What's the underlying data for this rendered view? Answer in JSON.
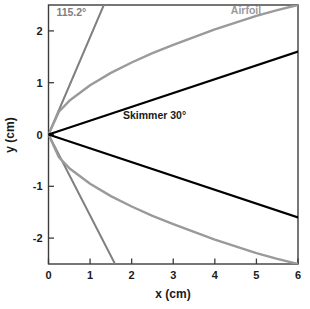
{
  "chart_data": {
    "type": "line",
    "title": "",
    "subtitle": "",
    "xlabel": "x (cm)",
    "ylabel": "y (cm)",
    "xlim": [
      0,
      6
    ],
    "ylim": [
      -2.5,
      2.5
    ],
    "xticks": [
      "0",
      "1",
      "2",
      "3",
      "4",
      "5",
      "6"
    ],
    "xtick_values": [
      0,
      1,
      2,
      3,
      4,
      5,
      6
    ],
    "yticks": [
      "2",
      "1",
      "0",
      "-1",
      "-2"
    ],
    "ytick_values": [
      2,
      1,
      0,
      -1,
      -2
    ],
    "grid": false,
    "legend": "inline-annotations",
    "background": "#ffffff",
    "frame_color": "#3c3c3c",
    "series": [
      {
        "name": "115.2°",
        "label": "115.2°",
        "color": "#808080",
        "shape": "straight-v-pair",
        "half_angle_deg": 57.6,
        "included_angle_deg": 115.2,
        "x": [
          0,
          1.33
        ],
        "values": [
          0,
          2.5
        ],
        "x_lower": [
          0,
          1.6
        ],
        "values_lower": [
          0,
          -2.5
        ],
        "label_x": 0.55,
        "label_y": 2.28
      },
      {
        "name": "Airfoil",
        "label": "Airfoil",
        "color": "#9a9a9a",
        "shape": "curved-v-pair",
        "exponent": 0.55,
        "x": [
          0,
          0.25,
          0.5,
          1,
          1.5,
          2,
          2.5,
          3,
          3.5,
          4,
          4.5,
          5,
          5.5,
          6
        ],
        "values": [
          0,
          0.44,
          0.65,
          0.95,
          1.19,
          1.39,
          1.57,
          1.73,
          1.88,
          2.03,
          2.16,
          2.29,
          2.4,
          2.5
        ],
        "x_lower": [
          0,
          0.25,
          0.5,
          1,
          1.5,
          2,
          2.5,
          3,
          3.5,
          4,
          4.5,
          5,
          5.5,
          6
        ],
        "values_lower": [
          0,
          -0.44,
          -0.65,
          -0.95,
          -1.19,
          -1.39,
          -1.57,
          -1.73,
          -1.88,
          -2.03,
          -2.16,
          -2.29,
          -2.4,
          -2.5
        ],
        "label_x": 4.75,
        "label_y": 2.33
      },
      {
        "name": "Skimmer 30°",
        "label": "Skimmer 30°",
        "color": "#000000",
        "shape": "straight-v-pair",
        "half_angle_deg": 15,
        "included_angle_deg": 30,
        "x": [
          0,
          6
        ],
        "values": [
          0,
          1.6
        ],
        "x_lower": [
          0,
          6
        ],
        "values_lower": [
          0,
          -1.6
        ],
        "label_x": 2.55,
        "label_y": 0.3
      }
    ],
    "annotations": [
      {
        "text": "115.2°",
        "x": 0.55,
        "y": 2.28,
        "color": "#808080"
      },
      {
        "text": "Airfoil",
        "x": 4.75,
        "y": 2.33,
        "color": "#9a9a9a"
      },
      {
        "text": "Skimmer 30°",
        "x": 2.55,
        "y": 0.3,
        "color": "#1a1a1a"
      }
    ]
  }
}
